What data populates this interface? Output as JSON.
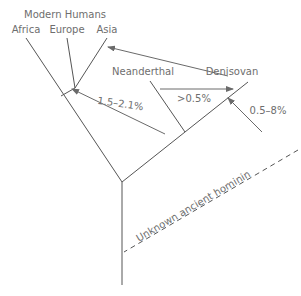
{
  "diagram": {
    "title": "Modern Humans",
    "labels": {
      "africa": "Africa",
      "europe": "Europe",
      "asia": "Asia",
      "neanderthal": "Neanderthal",
      "denisovan": "Denisovan",
      "unknown": "Unknown ancient hominin"
    },
    "admixture": {
      "neanderthal_to_eurasians": "1.5–2.1%",
      "neanderthal_to_denisovan": ">0.5%",
      "unknown_to_denisovan": "0.5–8%"
    },
    "colors": {
      "line": "#555555",
      "text": "#6e6e6e",
      "background": "#ffffff"
    }
  }
}
